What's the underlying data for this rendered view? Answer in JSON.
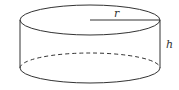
{
  "diagram": {
    "shape": "cylinder",
    "labels": {
      "radius": "r",
      "height": "h"
    },
    "colors": {
      "stroke": "#333333",
      "background": "#ffffff"
    }
  }
}
